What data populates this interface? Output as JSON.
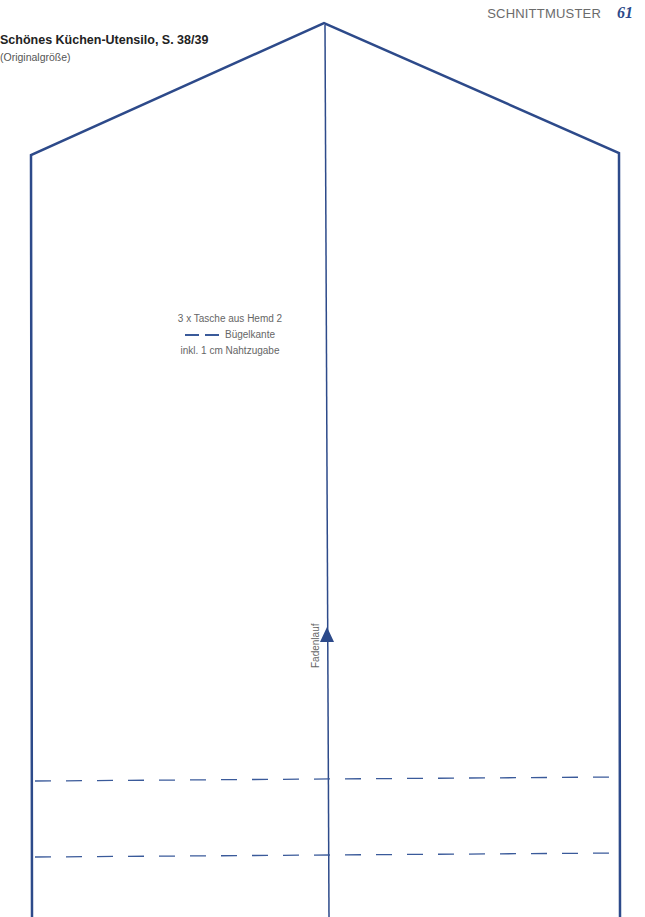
{
  "header": {
    "section": "SCHNITTMUSTER",
    "page_number": "61"
  },
  "pattern": {
    "title": "Schönes Küchen-Utensilo, S. 38/39",
    "subtitle": "(Originalgröße)",
    "piece_label": {
      "line1": "3 x Tasche aus Hemd 2",
      "legend_text": "Bügelkante",
      "line3": "inkl. 1 cm Nahtzugabe"
    },
    "grainline_label": "Fadenlauf",
    "colors": {
      "outline": "#2d4a8a",
      "fold_line": "#3a5a9a"
    }
  }
}
